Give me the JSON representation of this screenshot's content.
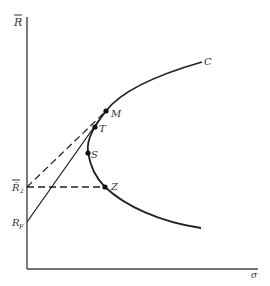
{
  "diagram": {
    "type": "efficient-frontier",
    "y_axis_label": "R̄",
    "x_axis_label": "σ",
    "curve_label": "C",
    "axis_labels": {
      "r_bar_2": "R̄₂",
      "r_bar_2_main": "R̄",
      "r_bar_2_sub": "2",
      "r_f": "R",
      "r_f_sub": "F"
    },
    "points": [
      {
        "id": "M",
        "label": "M"
      },
      {
        "id": "T",
        "label": "T"
      },
      {
        "id": "S",
        "label": "S"
      },
      {
        "id": "Z",
        "label": "Z"
      }
    ],
    "lines": [
      {
        "name": "solid line from R_F through T",
        "style": "solid"
      },
      {
        "name": "dashed line from R̄₂ to M",
        "style": "dashed"
      },
      {
        "name": "dashed horizontal from R̄₂ to Z",
        "style": "dashed"
      }
    ],
    "colors": {
      "ink": "#222222",
      "background": "#ffffff"
    }
  }
}
